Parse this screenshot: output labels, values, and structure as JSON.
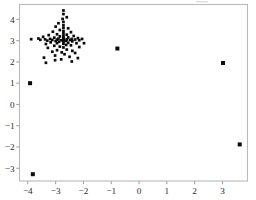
{
  "figure": {
    "background_color": "#ffffff",
    "frame_color": "#b9b9b9",
    "point_color": "#0b0b0b",
    "tick_text_color": "#2b2b2b"
  },
  "chart_data": {
    "type": "scatter",
    "title": "",
    "subtitle": "",
    "xlabel": "",
    "ylabel": "",
    "grid": false,
    "legend": null,
    "marker": "square",
    "marker_color": "#0b0b0b",
    "xlim": [
      -4.3,
      3.9
    ],
    "ylim": [
      -3.6,
      4.7
    ],
    "xticks": [
      -4,
      -3,
      -2,
      -1,
      0,
      1,
      2,
      3
    ],
    "yticks": [
      -3,
      -2,
      -1,
      0,
      1,
      2,
      3,
      4
    ],
    "xticklabels": [
      "−4",
      "−3",
      "−2",
      "−1",
      "0",
      "1",
      "2",
      "3"
    ],
    "yticklabels": [
      "−3",
      "−2",
      "−1",
      "0",
      "1",
      "2",
      "3",
      "4"
    ],
    "series": [
      {
        "name": "points",
        "points": [
          [
            -2.72,
            4.42
          ],
          [
            -2.72,
            4.25
          ],
          [
            -2.6,
            4.1
          ],
          [
            -2.75,
            4.02
          ],
          [
            -2.72,
            3.88
          ],
          [
            -2.9,
            3.82
          ],
          [
            -2.72,
            3.72
          ],
          [
            -3.0,
            3.66
          ],
          [
            -2.72,
            3.6
          ],
          [
            -2.55,
            3.58
          ],
          [
            -2.85,
            3.5
          ],
          [
            -2.72,
            3.45
          ],
          [
            -3.1,
            3.42
          ],
          [
            -2.45,
            3.4
          ],
          [
            -2.72,
            3.35
          ],
          [
            -2.95,
            3.3
          ],
          [
            -2.6,
            3.28
          ],
          [
            -3.25,
            3.26
          ],
          [
            -2.72,
            3.24
          ],
          [
            -2.35,
            3.22
          ],
          [
            -2.85,
            3.2
          ],
          [
            -3.45,
            3.18
          ],
          [
            -2.72,
            3.16
          ],
          [
            -2.55,
            3.15
          ],
          [
            -3.05,
            3.14
          ],
          [
            -2.2,
            3.12
          ],
          [
            -2.72,
            3.1
          ],
          [
            -3.62,
            3.1
          ],
          [
            -2.9,
            3.09
          ],
          [
            -2.42,
            3.08
          ],
          [
            -3.2,
            3.08
          ],
          [
            -2.05,
            3.08
          ],
          [
            -2.72,
            3.07
          ],
          [
            -3.88,
            3.07
          ],
          [
            -2.6,
            3.06
          ],
          [
            -3.38,
            3.06
          ],
          [
            -2.3,
            3.05
          ],
          [
            -2.95,
            3.05
          ],
          [
            -2.72,
            3.04
          ],
          [
            -3.55,
            3.04
          ],
          [
            -2.48,
            3.03
          ],
          [
            -3.12,
            3.03
          ],
          [
            -2.15,
            3.02
          ],
          [
            -2.8,
            3.02
          ],
          [
            -2.72,
            3.0
          ],
          [
            -3.3,
            3.0
          ],
          [
            -2.62,
            2.99
          ],
          [
            -3.0,
            2.98
          ],
          [
            -2.4,
            2.97
          ],
          [
            -2.88,
            2.95
          ],
          [
            -2.72,
            2.93
          ],
          [
            -3.18,
            2.92
          ],
          [
            -2.55,
            2.9
          ],
          [
            -2.95,
            2.88
          ],
          [
            -2.25,
            2.88
          ],
          [
            -1.98,
            2.88
          ],
          [
            -2.72,
            2.85
          ],
          [
            -3.35,
            2.84
          ],
          [
            -2.62,
            2.8
          ],
          [
            -2.45,
            2.78
          ],
          [
            -3.05,
            2.76
          ],
          [
            -2.85,
            2.72
          ],
          [
            -2.15,
            2.7
          ],
          [
            -2.72,
            2.68
          ],
          [
            -3.28,
            2.66
          ],
          [
            -0.78,
            2.63
          ],
          [
            -2.6,
            2.58
          ],
          [
            -2.95,
            2.55
          ],
          [
            -2.4,
            2.52
          ],
          [
            -3.12,
            2.48
          ],
          [
            -2.78,
            2.45
          ],
          [
            -2.3,
            2.42
          ],
          [
            -2.68,
            2.36
          ],
          [
            -3.02,
            2.3
          ],
          [
            -2.5,
            2.24
          ],
          [
            -3.42,
            2.2
          ],
          [
            -2.2,
            2.18
          ],
          [
            -2.8,
            2.12
          ],
          [
            -3.02,
            2.08
          ],
          [
            -2.42,
            2.02
          ],
          [
            -3.35,
            1.96
          ],
          [
            3.02,
            1.95
          ],
          [
            -3.92,
            1.0
          ],
          [
            3.62,
            -1.88
          ],
          [
            -3.82,
            -3.28
          ]
        ]
      }
    ]
  }
}
